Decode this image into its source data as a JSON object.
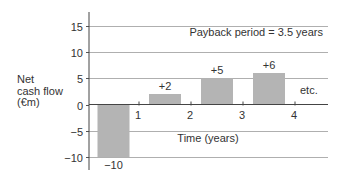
{
  "chart_data": {
    "type": "bar",
    "title": "",
    "xlabel": "Time (years)",
    "ylabel": "Net cash flow (€m)",
    "ylabel_lines": [
      "Net",
      "cash flow",
      "(€m)"
    ],
    "ylim": [
      -10,
      15
    ],
    "yticks": [
      15,
      10,
      5,
      0,
      -5,
      -10
    ],
    "ytick_labels": [
      "15",
      "10",
      "5",
      "0",
      "−5",
      "−10"
    ],
    "xticks": [
      1,
      2,
      3,
      4
    ],
    "xtick_labels": [
      "1",
      "2",
      "3",
      "4"
    ],
    "grid": true,
    "categories": [
      "Year 0",
      "Year 1",
      "Year 2",
      "Year 3"
    ],
    "values": [
      -10,
      2,
      5,
      6
    ],
    "value_labels": [
      "−10",
      "+2",
      "+5",
      "+6"
    ],
    "bar_color": "#b4b4b4",
    "annotations": [
      {
        "text": "Payback period = 3.5 years",
        "position": "top-right"
      },
      {
        "text": "etc.",
        "position": "after year 4"
      }
    ]
  }
}
